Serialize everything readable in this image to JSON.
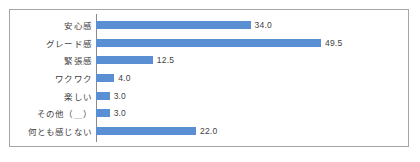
{
  "chart": {
    "axis_color": "#8a8a8a",
    "bar_color": "#5b8fd4",
    "frame_color": "#a6a6a6",
    "text_color": "#3f3f3f"
  },
  "chart_data": {
    "type": "bar",
    "orientation": "horizontal",
    "title": "",
    "xlabel": "",
    "ylabel": "",
    "grid": false,
    "legend": false,
    "xlim": [
      0,
      55
    ],
    "categories": [
      "安心感",
      "グレード感",
      "緊張感",
      "ワクワク",
      "楽しい",
      "その他（＿）",
      "何とも感じない"
    ],
    "values": [
      34.0,
      49.5,
      12.5,
      4.0,
      3.0,
      3.0,
      22.0
    ],
    "value_labels": [
      "34.0",
      "49.5",
      "12.5",
      "4.0",
      "3.0",
      "3.0",
      "22.0"
    ]
  }
}
